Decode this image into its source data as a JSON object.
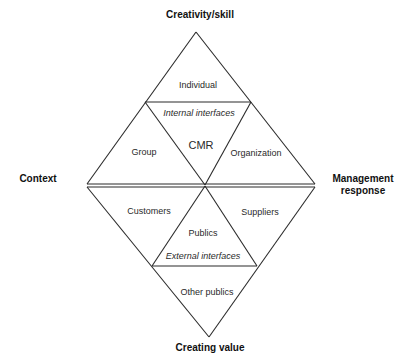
{
  "axes": {
    "top": "Creativity/skill",
    "left": "Context",
    "right_line1": "Management",
    "right_line2": "response",
    "bottom": "Creating value"
  },
  "upper_diamond": {
    "top_triangle": "Individual",
    "interface_label": "Internal interfaces",
    "center": "CMR",
    "left_triangle": "Group",
    "right_triangle": "Organization"
  },
  "lower_diamond": {
    "left_triangle": "Customers",
    "center": "Publics",
    "interface_label": "External interfaces",
    "right_triangle": "Suppliers",
    "bottom_triangle": "Other publics"
  },
  "colors": {
    "line": "#2a2a2a",
    "background": "#ffffff"
  }
}
